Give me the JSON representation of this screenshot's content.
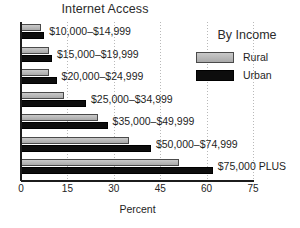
{
  "chart_data": {
    "type": "bar",
    "orientation": "horizontal",
    "title": "Internet Access",
    "xlabel": "Percent",
    "ylabel": "",
    "xlim": [
      0,
      75
    ],
    "xticks": [
      0,
      15,
      30,
      45,
      60,
      75
    ],
    "xticklabels": [
      "0",
      "15",
      "30",
      "45",
      "60",
      "75"
    ],
    "grid": true,
    "grid_axis": "x",
    "legend_title": "By Income",
    "legend_position": "upper right",
    "categories": [
      "$10,000–$14,999",
      "$15,000–$19,999",
      "$20,000–$24,999",
      "$25,000–$34,999",
      "$35,000–$49,999",
      "$50,000–$74,999",
      "$75,000 PLUS"
    ],
    "series": [
      {
        "name": "Rural",
        "color": "#b7b7b7",
        "values": [
          6.5,
          9.0,
          9.0,
          14.0,
          25.0,
          35.0,
          51.0
        ]
      },
      {
        "name": "Urban",
        "color": "#0d0d0d",
        "values": [
          7.5,
          10.0,
          11.5,
          21.0,
          28.0,
          42.0,
          62.0
        ]
      }
    ]
  },
  "legend": {
    "title": "By Income",
    "entries": [
      {
        "label": "Rural",
        "swatch": "rural-swatch"
      },
      {
        "label": "Urban",
        "swatch": "urban-swatch"
      }
    ]
  }
}
